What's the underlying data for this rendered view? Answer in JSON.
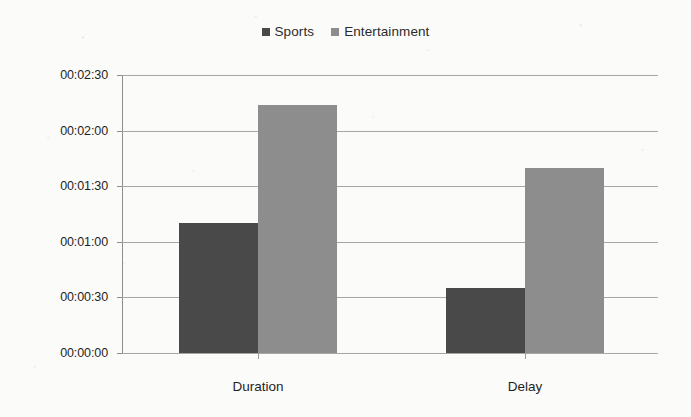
{
  "chart_data": {
    "type": "bar",
    "title": "",
    "subtitle": "",
    "xlabel": "",
    "ylabel": "",
    "categories": [
      "Duration",
      "Delay"
    ],
    "series": [
      {
        "name": "Sports",
        "color": "#494949",
        "values": [
          "00:01:10",
          "00:00:35"
        ],
        "seconds": [
          70,
          35
        ]
      },
      {
        "name": "Entertainment",
        "color": "#8d8d8d",
        "values": [
          "00:02:14",
          "00:01:40"
        ],
        "seconds": [
          134,
          100
        ]
      }
    ],
    "y_tick_labels": [
      "00:02:30",
      "00:02:00",
      "00:01:30",
      "00:01:00",
      "00:00:30",
      "00:00:00"
    ],
    "y_tick_seconds": [
      150,
      120,
      90,
      60,
      30,
      0
    ],
    "ylim": [
      0,
      150
    ],
    "grid": "horizontal",
    "legend_position": "top-center"
  },
  "legend": {
    "entries": [
      {
        "label": "Sports",
        "color": "#494949"
      },
      {
        "label": "Entertainment",
        "color": "#8d8d8d"
      }
    ]
  },
  "axes": {
    "y_ticks": [
      "00:02:30",
      "00:02:00",
      "00:01:30",
      "00:01:00",
      "00:00:30",
      "00:00:00"
    ],
    "x_ticks": [
      "Duration",
      "Delay"
    ]
  }
}
